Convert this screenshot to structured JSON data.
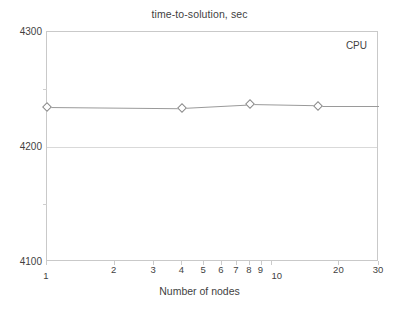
{
  "chart_data": {
    "type": "scatter",
    "title": "time-to-solution, sec",
    "xlabel": "Number of nodes",
    "ylabel": "",
    "xscale": "log",
    "yscale": "linear",
    "xlim": [
      1,
      30
    ],
    "ylim": [
      4100,
      4300
    ],
    "grid": true,
    "legend_position": "top-right",
    "series": [
      {
        "name": "CPU",
        "marker": "open-diamond",
        "x": [
          1,
          4,
          8,
          16
        ],
        "values": [
          4235,
          4234,
          4237,
          4236
        ]
      }
    ],
    "x_ticks": [
      {
        "value": 1,
        "label": "1"
      },
      {
        "value": 2,
        "label": "2"
      },
      {
        "value": 3,
        "label": "3"
      },
      {
        "value": 4,
        "label": "4"
      },
      {
        "value": 5,
        "label": "5"
      },
      {
        "value": 6,
        "label": "6"
      },
      {
        "value": 7,
        "label": "7"
      },
      {
        "value": 8,
        "label": "8"
      },
      {
        "value": 9,
        "label": "9"
      },
      {
        "value": 10,
        "label": "10"
      },
      {
        "value": 20,
        "label": "20"
      },
      {
        "value": 30,
        "label": "30"
      }
    ],
    "y_ticks": [
      {
        "value": 4100,
        "label": "4100"
      },
      {
        "value": 4200,
        "label": "4200"
      },
      {
        "value": 4300,
        "label": "4300"
      }
    ],
    "legend_label": "CPU"
  },
  "colors": {
    "plot_border": "#c9c9c9",
    "gridline": "#d9d9d9",
    "series_line": "#9a9a9a",
    "marker_stroke": "#8a8a8a",
    "text": "#3f3f3f",
    "background": "#ffffff"
  }
}
